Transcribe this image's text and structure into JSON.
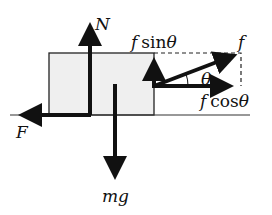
{
  "diagram": {
    "labels": {
      "normal": "N",
      "weight": "mg",
      "friction": "F",
      "applied": "f",
      "vertical_component_f": "f",
      "vertical_component_fn": "sin",
      "horizontal_component_f": "f",
      "horizontal_component_fn": "cos",
      "theta": "θ"
    },
    "colors": {
      "block_fill": "#efefef",
      "stroke": "#111111"
    }
  }
}
